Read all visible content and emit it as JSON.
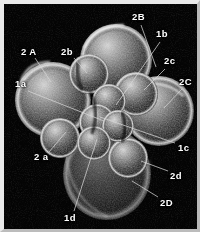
{
  "figure": {
    "kind": "scanning-electron-micrograph",
    "background_color": "#040404",
    "frame_color": "#e9e9e9",
    "label_color": "#ffffff",
    "leader_line_color": "#d8d8d8"
  },
  "labels": [
    {
      "id": "2B",
      "text": "2B",
      "x": 128,
      "y": 8,
      "lx": 137,
      "ly": 21,
      "tx": 152,
      "ty": 63
    },
    {
      "id": "1b",
      "text": "1b",
      "x": 152,
      "y": 25,
      "lx": 156,
      "ly": 38,
      "tx": 112,
      "ty": 101
    },
    {
      "id": "2b",
      "text": "2b",
      "x": 57,
      "y": 43,
      "lx": 70,
      "ly": 54,
      "tx": 83,
      "ty": 69
    },
    {
      "id": "2A",
      "text": "2 A",
      "x": 17,
      "y": 43,
      "lx": 31,
      "ly": 54,
      "tx": 47,
      "ty": 78
    },
    {
      "id": "2c",
      "text": "2c",
      "x": 160,
      "y": 52,
      "lx": 161,
      "ly": 65,
      "tx": 140,
      "ty": 86
    },
    {
      "id": "2C",
      "text": "2C",
      "x": 175,
      "y": 73,
      "lx": 178,
      "ly": 85,
      "tx": 160,
      "ty": 104
    },
    {
      "id": "1a",
      "text": "1a",
      "x": 11,
      "y": 75,
      "lx": 24,
      "ly": 87,
      "tx": 100,
      "ty": 117
    },
    {
      "id": "1c",
      "text": "1c",
      "x": 174,
      "y": 139,
      "lx": 171,
      "ly": 139,
      "tx": 96,
      "ty": 113
    },
    {
      "id": "2a",
      "text": "2 a",
      "x": 30,
      "y": 148,
      "lx": 45,
      "ly": 148,
      "tx": 62,
      "ty": 128
    },
    {
      "id": "2d",
      "text": "2d",
      "x": 166,
      "y": 167,
      "lx": 164,
      "ly": 167,
      "tx": 137,
      "ty": 157
    },
    {
      "id": "2D",
      "text": "2D",
      "x": 156,
      "y": 194,
      "lx": 154,
      "ly": 193,
      "tx": 128,
      "ty": 177
    },
    {
      "id": "1d",
      "text": "1d",
      "x": 60,
      "y": 209,
      "lx": 70,
      "ly": 207,
      "tx": 93,
      "ty": 135
    }
  ],
  "cells": [
    {
      "name": "blastomere-2A",
      "cx": 48,
      "cy": 95,
      "r": 36,
      "tone": 0.5
    },
    {
      "name": "blastomere-2B",
      "cx": 110,
      "cy": 55,
      "r": 34,
      "tone": 0.58
    },
    {
      "name": "blastomere-2C",
      "cx": 155,
      "cy": 106,
      "r": 33,
      "tone": 0.55
    },
    {
      "name": "blastomere-2D",
      "cx": 103,
      "cy": 168,
      "r": 40,
      "tone": 0.26
    },
    {
      "name": "blastomere-2b",
      "cx": 84,
      "cy": 70,
      "r": 19,
      "tone": 0.62
    },
    {
      "name": "blastomere-2c",
      "cx": 131,
      "cy": 90,
      "r": 21,
      "tone": 0.6
    },
    {
      "name": "blastomere-2a",
      "cx": 56,
      "cy": 133,
      "r": 19,
      "tone": 0.52
    },
    {
      "name": "blastomere-2d",
      "cx": 123,
      "cy": 153,
      "r": 19,
      "tone": 0.58
    },
    {
      "name": "blastomere-1a",
      "cx": 97,
      "cy": 119,
      "r": 17,
      "tone": 0.66
    },
    {
      "name": "blastomere-1b",
      "cx": 105,
      "cy": 97,
      "r": 16,
      "tone": 0.7
    },
    {
      "name": "blastomere-1c",
      "cx": 112,
      "cy": 122,
      "r": 15,
      "tone": 0.64
    },
    {
      "name": "blastomere-1d",
      "cx": 88,
      "cy": 137,
      "r": 16,
      "tone": 0.6
    }
  ]
}
